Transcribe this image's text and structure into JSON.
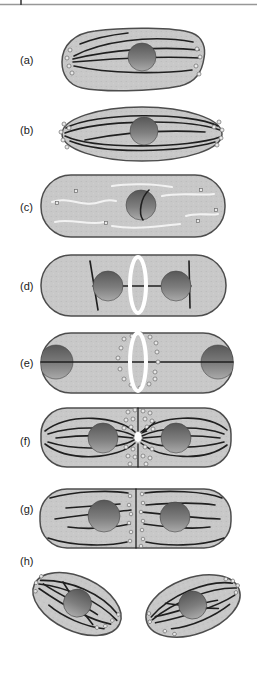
{
  "figure": {
    "name": "cell-division-microtubule-stages",
    "panels": [
      {
        "id": "a",
        "label": "(a)"
      },
      {
        "id": "b",
        "label": "(b)"
      },
      {
        "id": "c",
        "label": "(c)"
      },
      {
        "id": "d",
        "label": "(d)"
      },
      {
        "id": "e",
        "label": "(e)"
      },
      {
        "id": "f",
        "label": "(f)"
      },
      {
        "id": "g",
        "label": "(g)"
      },
      {
        "id": "h",
        "label": "(h)"
      }
    ],
    "colors": {
      "background": "#ffffff",
      "cell_fill": "#c8c8c8",
      "cell_outline": "#4d4d4d",
      "nucleus_dark": "#575757",
      "nucleus_light": "#aaaaaa",
      "microtubule": "#1f1f1f",
      "depolymerized_microtubule": "#f2f2f2",
      "ring": "#ffffff",
      "vesicle_fill": "#e8e8e8",
      "vesicle_stroke": "#6e6e6e",
      "page_rule": "#979797"
    }
  }
}
